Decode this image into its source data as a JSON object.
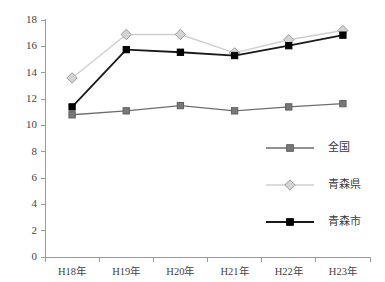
{
  "chart_data": {
    "type": "line",
    "title": "",
    "subtitle": "",
    "xlabel": "",
    "ylabel": "",
    "categories": [
      "H18年",
      "H19年",
      "H20年",
      "H21年",
      "H22年",
      "H23年"
    ],
    "ylim": [
      0,
      18
    ],
    "ytick_labels": [
      "0",
      "2",
      "4",
      "6",
      "8",
      "10",
      "12",
      "14",
      "16",
      "18"
    ],
    "ytick_values": [
      0,
      2,
      4,
      6,
      8,
      10,
      12,
      14,
      16,
      18
    ],
    "grid": false,
    "legend_position": "right-middle",
    "series": [
      {
        "name": "全国",
        "marker": "square",
        "color": "#6e6e6e",
        "marker_fill": "#787878",
        "values": [
          10.8,
          11.1,
          11.5,
          11.1,
          11.4,
          11.65
        ]
      },
      {
        "name": "青森県",
        "marker": "diamond",
        "color": "#cfcfcf",
        "marker_fill": "#d4d4d4",
        "values": [
          13.6,
          16.9,
          16.9,
          15.5,
          16.5,
          17.2
        ]
      },
      {
        "name": "青森市",
        "marker": "square",
        "color": "#1a1a1a",
        "marker_fill": "#000000",
        "values": [
          11.4,
          15.75,
          15.55,
          15.3,
          16.05,
          16.85
        ]
      }
    ]
  },
  "axis": {
    "line_color": "#9a9a9a",
    "tick_color": "#9a9a9a"
  }
}
